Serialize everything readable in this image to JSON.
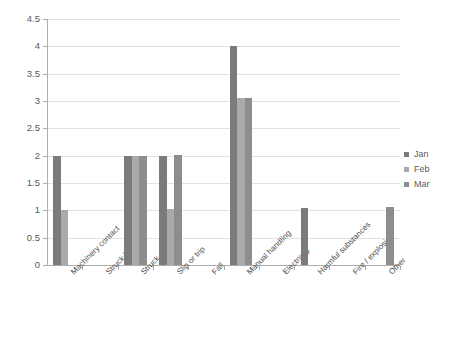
{
  "chart_data": {
    "type": "bar",
    "title": "",
    "xlabel": "",
    "ylabel": "",
    "ylim": [
      0,
      4.5
    ],
    "ytick_step": 0.5,
    "grid": true,
    "legend_position": "right",
    "categories": [
      "Machinery contact",
      "Struck by",
      "Struck against",
      "Slip or trip",
      "Fall",
      "Manual handling",
      "Electricity",
      "Harmful substances",
      "Fire / explosion",
      "Other"
    ],
    "ytick_labels": [
      "0",
      "0.5",
      "1",
      "1.5",
      "2",
      "2.5",
      "3",
      "3.5",
      "4",
      "4.5"
    ],
    "series": [
      {
        "name": "Jan",
        "color": "#7b7b7b",
        "values": [
          2,
          0,
          2,
          2,
          0,
          4,
          0,
          1.05,
          0,
          0
        ]
      },
      {
        "name": "Feb",
        "color": "#aaaaaa",
        "values": [
          1,
          0,
          2,
          1.02,
          0,
          3.05,
          0,
          0,
          0,
          0
        ]
      },
      {
        "name": "Mar",
        "color": "#8d8d8d",
        "values": [
          0,
          0,
          2,
          2.02,
          0,
          3.05,
          0,
          0,
          0,
          1.07
        ]
      }
    ]
  },
  "legend": {
    "items": [
      {
        "label": "Jan",
        "color": "#7b7b7b"
      },
      {
        "label": "Feb",
        "color": "#aaaaaa"
      },
      {
        "label": "Mar",
        "color": "#8d8d8d"
      }
    ]
  }
}
